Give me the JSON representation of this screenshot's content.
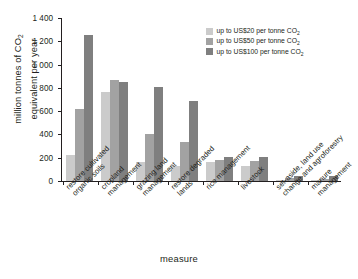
{
  "chart_data": {
    "type": "bar",
    "title": "",
    "xlabel": "measure",
    "ylabel": "million tonnes of CO₂ equivalent per year",
    "ylabel_main": "million tonnes of CO",
    "ylabel_sub": "2",
    "ylabel_line2": "equivalent per year",
    "ylim": [
      0,
      1400
    ],
    "ytick_values": [
      0,
      200,
      400,
      600,
      800,
      1000,
      1200,
      1400
    ],
    "ytick_labels": [
      "0",
      "200",
      "400",
      "600",
      "800",
      "1 000",
      "1 200",
      "1 400"
    ],
    "grid": false,
    "legend_position": "top-right",
    "categories": [
      "restore cultivated organic soils",
      "cropland management",
      "grazing land management",
      "restore degraded lands",
      "rice management",
      "livestock",
      "set-aside, land use change and agroforestry",
      "manure management"
    ],
    "category_lines": [
      [
        "restore cultivated",
        "organic soils"
      ],
      [
        "cropland",
        "management"
      ],
      [
        "grazing land",
        "management"
      ],
      [
        "restore degraded",
        "lands"
      ],
      [
        "rice management",
        ""
      ],
      [
        "livestock",
        ""
      ],
      [
        "set-aside, land use",
        "change and agroforestry"
      ],
      [
        "manure",
        "management"
      ]
    ],
    "series": [
      {
        "name": "up to US$20 per tonne CO₂",
        "name_main": "up to US$20 per tonne CO",
        "name_sub": "2",
        "color": "#cbcbcb",
        "values": [
          225,
          765,
          160,
          130,
          160,
          125,
          8,
          5
        ]
      },
      {
        "name": "up to US$50 per tonne CO₂",
        "name_main": "up to US$50 per tonne CO",
        "name_sub": "2",
        "color": "#a2a2a2",
        "values": [
          620,
          870,
          400,
          335,
          180,
          168,
          22,
          18
        ]
      },
      {
        "name": "up to  US$100 per tonne CO₂",
        "name_main": "up to  US$100 per tonne CO",
        "name_sub": "2",
        "color": "#7f7f7f",
        "values": [
          1255,
          850,
          810,
          690,
          205,
          205,
          45,
          45
        ]
      }
    ]
  }
}
